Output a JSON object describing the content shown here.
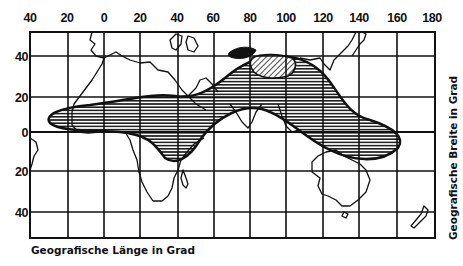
{
  "map": {
    "type": "world-map-grid",
    "axes": {
      "x_title": "Geografische Länge in Grad",
      "y_title": "Geografische Breite in Grad",
      "x_ticks": [
        "40",
        "20",
        "0",
        "20",
        "40",
        "60",
        "80",
        "100",
        "120",
        "140",
        "160",
        "180"
      ],
      "y_ticks": [
        "40",
        "20",
        "0",
        "20",
        "40"
      ]
    },
    "regions": [
      {
        "name": "horizontal-hatched-region",
        "description": "Band from West Africa across Arabia, India, SE Asia to Indonesia/New Guinea",
        "pattern": "horizontal-lines"
      },
      {
        "name": "diagonal-hatched-region",
        "description": "Central Asia area north of the band",
        "pattern": "diagonal-lines"
      }
    ],
    "colors": {
      "ink": "#111111",
      "background": "#ffffff"
    }
  }
}
